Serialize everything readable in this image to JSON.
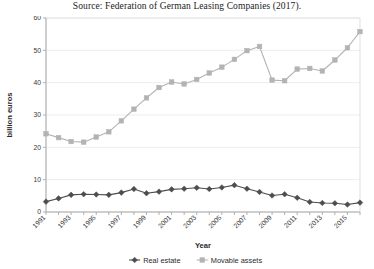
{
  "source": {
    "caption": "Source: Federation of German Leasing Companies (2017)."
  },
  "chart_data": {
    "type": "line",
    "title": "",
    "xlabel": "Year",
    "ylabel": "billion euros",
    "ylim": [
      0,
      60
    ],
    "ytick_values": [
      0,
      10,
      20,
      30,
      40,
      50,
      60
    ],
    "ytick_labels": [
      "0",
      "10",
      "20",
      "30",
      "40",
      "50",
      "60"
    ],
    "grid": true,
    "legend_position": "bottom",
    "x": [
      1991,
      1992,
      1993,
      1994,
      1995,
      1996,
      1997,
      1998,
      1999,
      2000,
      2001,
      2002,
      2003,
      2004,
      2005,
      2006,
      2007,
      2008,
      2009,
      2010,
      2011,
      2012,
      2013,
      2014,
      2015,
      2016
    ],
    "xtick_labels": [
      "1991",
      "1993",
      "1995",
      "1997",
      "1999",
      "2001",
      "2003",
      "2005",
      "2007",
      "2009",
      "2011",
      "2013",
      "2015"
    ],
    "xtick_values": [
      1991,
      1993,
      1995,
      1997,
      1999,
      2001,
      2003,
      2005,
      2007,
      2009,
      2011,
      2013,
      2015
    ],
    "series": [
      {
        "name": "Real estate",
        "color": "#4d4d4d",
        "marker": "diamond",
        "values": [
          3.2,
          4.2,
          5.3,
          5.5,
          5.4,
          5.3,
          6.0,
          7.1,
          5.8,
          6.3,
          7.0,
          7.2,
          7.5,
          7.1,
          7.6,
          8.3,
          7.2,
          6.2,
          5.1,
          5.5,
          4.4,
          3.1,
          2.8,
          2.7,
          2.3,
          2.9
        ]
      },
      {
        "name": "Movable assets",
        "color": "#b3b3b3",
        "marker": "square",
        "values": [
          24.2,
          23.0,
          21.8,
          21.6,
          23.2,
          24.8,
          28.2,
          31.8,
          35.3,
          38.5,
          40.2,
          39.6,
          41.0,
          43.0,
          44.8,
          47.2,
          49.9,
          51.2,
          40.8,
          40.6,
          44.2,
          44.4,
          43.6,
          47.0,
          50.8,
          55.8
        ]
      }
    ]
  },
  "legend": {
    "items": [
      {
        "label": "Real estate",
        "marker": "diamond",
        "color": "#4d4d4d"
      },
      {
        "label": "Movable assets",
        "marker": "square",
        "color": "#b3b3b3"
      }
    ]
  }
}
